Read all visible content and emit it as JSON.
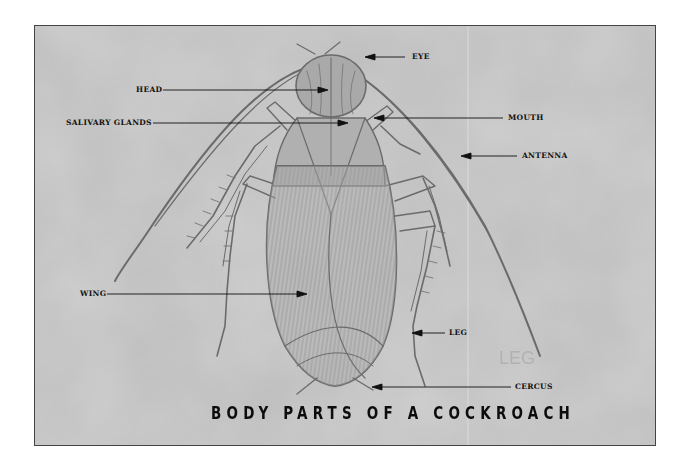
{
  "diagram": {
    "title": "BODY PARTS OF A COCKROACH",
    "subject": "cockroach",
    "style": "pencil sketch on grey textured paper",
    "colors": {
      "background": "#b9b9b9",
      "sketch": "#6a6a6a",
      "label_text": "#111111",
      "arrow": "#111111",
      "frame_border": "#444444",
      "page": "#ffffff"
    },
    "labels": [
      {
        "id": "eye",
        "text": "EYE",
        "side": "right"
      },
      {
        "id": "head",
        "text": "HEAD",
        "side": "left"
      },
      {
        "id": "salivary-glands",
        "text": "SALIVARY GLANDS",
        "side": "left"
      },
      {
        "id": "mouth",
        "text": "MOUTH",
        "side": "right"
      },
      {
        "id": "antenna",
        "text": "ANTENNA",
        "side": "right"
      },
      {
        "id": "wing",
        "text": "WING",
        "side": "left"
      },
      {
        "id": "leg",
        "text": "LEG",
        "side": "right"
      },
      {
        "id": "cercus",
        "text": "CERCUS",
        "side": "right"
      }
    ],
    "watermark_text": "LEG"
  }
}
